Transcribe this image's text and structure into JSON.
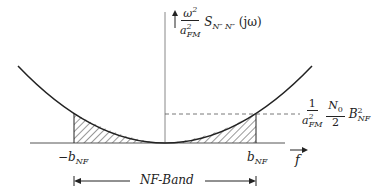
{
  "diagram": {
    "y_axis_label": {
      "frac_num": "ω",
      "frac_num_sup": "2",
      "frac_den": "a",
      "frac_den_sup": "2",
      "frac_den_sub": "FM",
      "func": "S",
      "func_sub": "N″ N″",
      "arg": "(jω)"
    },
    "level_label": {
      "frac1_num": "1",
      "frac1_den": "a",
      "frac1_den_sup": "2",
      "frac1_den_sub": "FM",
      "frac2_num": "N",
      "frac2_num_sub": "0",
      "frac2_den": "2",
      "b": "B",
      "b_sup": "2",
      "b_sub": "NF"
    },
    "x_axis_label": "f",
    "left_tick": {
      "prefix": "−b",
      "sub": "NF"
    },
    "right_tick": {
      "prefix": "b",
      "sub": "NF"
    },
    "band_label": "NF-Band",
    "colors": {
      "line": "#222222",
      "axis": "#888888"
    }
  }
}
